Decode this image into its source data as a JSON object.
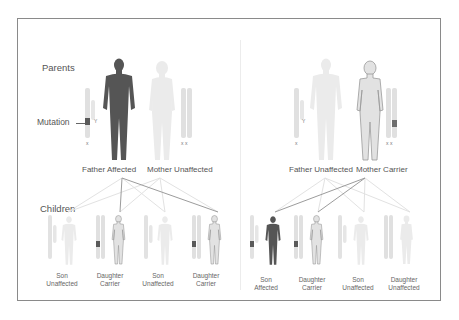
{
  "diagram": {
    "labels": {
      "parents": "Parents",
      "children": "Children",
      "mutation": "Mutation"
    },
    "colors": {
      "affected": "#555555",
      "carrier_fill": "#e2e2e2",
      "carrier_outline": "#9a9a9a",
      "unaffected": "#ececec",
      "mutation_band": "#6e6e6e",
      "line_strong": "#9c9c9c",
      "line_faint": "#e4e4e4",
      "frame": "#8a8a8a"
    },
    "left_panel": {
      "father": {
        "label": "Father Affected",
        "status": "affected",
        "chromosomes": [
          "X",
          "Y"
        ]
      },
      "mother": {
        "label": "Mother Unaffected",
        "status": "unaffected",
        "chromosomes": [
          "X",
          "X"
        ]
      },
      "children": [
        {
          "line1": "Son",
          "line2": "Unaffected",
          "status": "unaffected",
          "sex": "male",
          "chromosomes": [
            "X",
            "Y"
          ]
        },
        {
          "line1": "Daughter",
          "line2": "Carrier",
          "status": "carrier",
          "sex": "female",
          "chromosomes": [
            "X",
            "X"
          ]
        },
        {
          "line1": "Son",
          "line2": "Unaffected",
          "status": "unaffected",
          "sex": "male",
          "chromosomes": [
            "X",
            "Y"
          ]
        },
        {
          "line1": "Daughter",
          "line2": "Carrier",
          "status": "carrier",
          "sex": "female",
          "chromosomes": [
            "X",
            "X"
          ]
        }
      ]
    },
    "right_panel": {
      "father": {
        "label": "Father Unaffected",
        "status": "unaffected",
        "chromosomes": [
          "X",
          "Y"
        ]
      },
      "mother": {
        "label": "Mother Carrier",
        "status": "carrier",
        "chromosomes": [
          "X",
          "X"
        ]
      },
      "children": [
        {
          "line1": "Son",
          "line2": "Affected",
          "status": "affected",
          "sex": "male",
          "chromosomes": [
            "X",
            "Y"
          ]
        },
        {
          "line1": "Daughter",
          "line2": "Carrier",
          "status": "carrier",
          "sex": "female",
          "chromosomes": [
            "X",
            "X"
          ]
        },
        {
          "line1": "Son",
          "line2": "Unaffected",
          "status": "unaffected",
          "sex": "male",
          "chromosomes": [
            "X",
            "Y"
          ]
        },
        {
          "line1": "Daughter",
          "line2": "Unaffected",
          "status": "unaffected",
          "sex": "female",
          "chromosomes": [
            "X",
            "X"
          ]
        }
      ]
    }
  }
}
